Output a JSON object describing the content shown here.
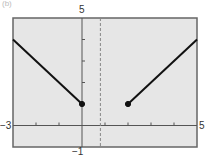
{
  "panel_label": "(b)",
  "chart_data": {
    "type": "line",
    "title": "",
    "xlabel": "",
    "ylabel": "",
    "xlim": [
      -3,
      5
    ],
    "ylim": [
      -1,
      5
    ],
    "grid": false,
    "tick_labels": {
      "xmin": "−3",
      "xmax": "5",
      "ymin": "−1",
      "ymax": "5"
    },
    "x_ticks": [
      -2,
      -1,
      1,
      2,
      3,
      4
    ],
    "y_ticks": [
      1,
      2,
      3,
      4
    ],
    "series": [
      {
        "name": "left-piece",
        "points": [
          [
            -3,
            4
          ],
          [
            0,
            1
          ]
        ],
        "endpoint": {
          "x": 0,
          "y": 1,
          "filled": true
        }
      },
      {
        "name": "right-piece",
        "points": [
          [
            2,
            1
          ],
          [
            5,
            4
          ]
        ],
        "endpoint": {
          "x": 2,
          "y": 1,
          "filled": true
        }
      }
    ],
    "dashed_vertical": {
      "x": 0.8
    },
    "colors": {
      "frame_fill": "#e6e6e6",
      "frame_border": "#666666",
      "line": "#111111",
      "axis": "#555555",
      "dashed": "#888888"
    }
  }
}
